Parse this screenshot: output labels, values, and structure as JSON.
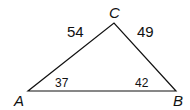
{
  "diagram": {
    "type": "triangle",
    "stroke_color": "#111111",
    "vertices": [
      {
        "name": "A",
        "x": 28,
        "y": 91
      },
      {
        "name": "B",
        "x": 176,
        "y": 91
      },
      {
        "name": "C",
        "x": 114,
        "y": 23
      }
    ],
    "labels": {
      "vertex_a": "A",
      "vertex_b": "B",
      "vertex_c": "C",
      "side_ac": "54",
      "side_bc": "49",
      "angle_a": "37",
      "angle_b": "42"
    }
  }
}
